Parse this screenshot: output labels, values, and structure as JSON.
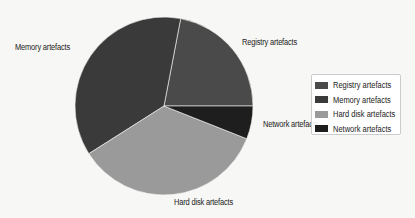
{
  "chart_data": {
    "type": "pie",
    "title": "",
    "categories": [
      "Registry artefacts",
      "Memory artefacts",
      "Hard disk artefacts",
      "Network artefacts"
    ],
    "values": [
      22,
      37,
      35,
      6
    ],
    "start_angle_deg": 0,
    "direction": "counterclockwise",
    "colors": [
      "#4a4a4a",
      "#3a3a3a",
      "#9a9a9a",
      "#1e1e1e"
    ],
    "legend_position": "right",
    "slice_labels": [
      "Registry artefacts",
      "Memory artefacts",
      "Hard disk artefacts",
      "Network artefacts"
    ]
  },
  "legend": {
    "items": [
      {
        "label": "Registry artefacts",
        "color": "#4a4a4a"
      },
      {
        "label": "Memory artefacts",
        "color": "#3a3a3a"
      },
      {
        "label": "Hard disk artefacts",
        "color": "#9a9a9a"
      },
      {
        "label": "Network artefacts",
        "color": "#1e1e1e"
      }
    ]
  },
  "labels": {
    "registry": "Registry artefacts",
    "memory": "Memory artefacts",
    "hard_disk": "Hard disk artefacts",
    "network": "Network artefacts"
  }
}
